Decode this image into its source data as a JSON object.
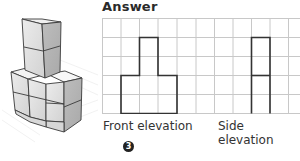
{
  "title": "Answer",
  "labels": {
    "front": "Front elevation",
    "side": "Side elevation"
  },
  "question_number": "3",
  "grid": {
    "columns": 11,
    "rows": 5,
    "cell_width": 18.5,
    "cell_height": 19,
    "line_color": "#c8c8c8",
    "outline_color": "#333333"
  },
  "front_elevation": {
    "description": "Three columns wide, two units tall, with middle column extending to four units",
    "columns_heights": [
      2,
      4,
      2
    ]
  },
  "side_elevation": {
    "description": "One column wide, four units tall, with divider at two units",
    "columns_heights": [
      4
    ]
  },
  "isometric": {
    "description": "3D cube stack: bottom layer 2 rows deep, 3 cubes wide front; tower of 2 extra cubes on top middle-back",
    "face_colors": {
      "top": "#f4f4f4",
      "left": "#dedede",
      "right": "#b9b9b9"
    }
  }
}
